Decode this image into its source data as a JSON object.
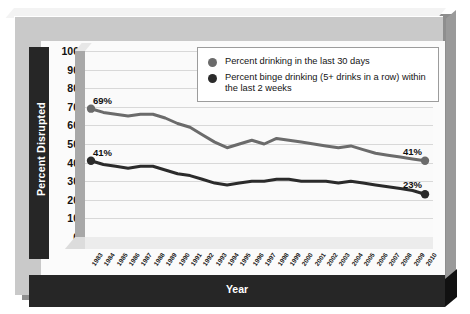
{
  "chart_data": {
    "type": "line",
    "title": "",
    "xlabel": "Year",
    "ylabel": "Percent Disrupted",
    "ylim": [
      0,
      100
    ],
    "ytick_step": 10,
    "yticks": [
      100,
      90,
      80,
      70,
      60,
      50,
      40,
      30,
      20,
      10,
      0
    ],
    "grid": true,
    "legend_position": "top-right",
    "categories": [
      "1983",
      "1984",
      "1985",
      "1986",
      "1987",
      "1988",
      "1989",
      "1990",
      "1991",
      "1992",
      "1993",
      "1994",
      "1995",
      "1996",
      "1997",
      "1998",
      "1999",
      "2000",
      "2001",
      "2002",
      "2003",
      "2004",
      "2005",
      "2006",
      "2007",
      "2008",
      "2009",
      "2010"
    ],
    "series": [
      {
        "name": "Percent drinking in the last 30 days",
        "color": "#6b6b6b",
        "values": [
          69,
          67,
          66,
          65,
          66,
          66,
          64,
          61,
          59,
          55,
          51,
          48,
          50,
          52,
          50,
          53,
          52,
          51,
          50,
          49,
          48,
          49,
          47,
          45,
          44,
          43,
          42,
          41
        ],
        "endpoint_labels": {
          "start": "69%",
          "end": "41%"
        }
      },
      {
        "name": "Percent binge drinking (5+ drinks in a row) within the last 2 weeks",
        "color": "#2b2b2b",
        "values": [
          41,
          39,
          38,
          37,
          38,
          38,
          36,
          34,
          33,
          31,
          29,
          28,
          29,
          30,
          30,
          31,
          31,
          30,
          30,
          30,
          29,
          30,
          29,
          28,
          27,
          26,
          25,
          23
        ],
        "endpoint_labels": {
          "start": "41%",
          "end": "23%"
        }
      }
    ]
  },
  "legend": {
    "items": [
      {
        "marker": "circle",
        "label": "Percent drinking in the last 30 days",
        "color": "#6b6b6b"
      },
      {
        "marker": "circle",
        "label": "Percent binge drinking (5+ drinks in a row) within the last 2 weeks",
        "color": "#2b2b2b"
      }
    ]
  },
  "labels": {
    "y_axis_title": "Percent Disrupted",
    "x_axis_title": "Year",
    "top_series_start": "69%",
    "top_series_end": "41%",
    "bottom_series_start": "41%",
    "bottom_series_end": "23%"
  },
  "colors": {
    "frame": "#c9c9c9",
    "band": "#262626",
    "plot_bg": "#fafafa",
    "grid": "#d8d8d8",
    "series_top": "#6b6b6b",
    "series_bottom": "#2b2b2b"
  }
}
